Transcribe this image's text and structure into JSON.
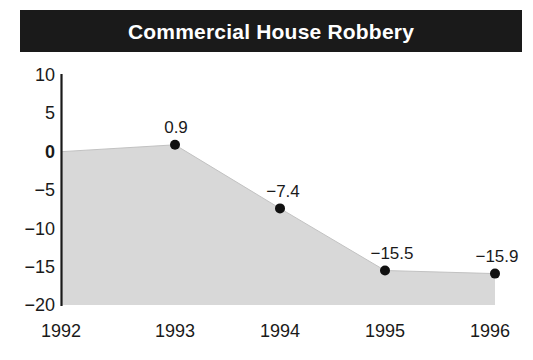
{
  "title": "Commercial House Robbery",
  "colors": {
    "title_bar_bg": "#1a1a1a",
    "title_text": "#ffffff",
    "area_fill": "#d8d8d8",
    "axis_line": "#1a1a1a",
    "marker": "#111111",
    "text": "#1a1a1a",
    "page_bg": "#ffffff"
  },
  "axis": {
    "y_ticks": [
      "10",
      "5",
      "0",
      "−5",
      "−10",
      "−15",
      "−20"
    ],
    "x_ticks": [
      "1992",
      "1993",
      "1994",
      "1995",
      "1996"
    ]
  },
  "point_labels": {
    "1993": "0.9",
    "1994": "−7.4",
    "1995": "−15.5",
    "1996": "−15.9"
  },
  "chart_data": {
    "type": "area",
    "title": "Commercial House Robbery",
    "subtitle": "",
    "xlabel": "",
    "ylabel": "",
    "categories": [
      "1992",
      "1993",
      "1994",
      "1995",
      "1996"
    ],
    "values": [
      0,
      0.9,
      -7.4,
      -15.5,
      -15.9
    ],
    "data_labels": [
      "",
      "0.9",
      "−7.4",
      "−15.5",
      "−15.9"
    ],
    "markers": [
      false,
      true,
      true,
      true,
      true
    ],
    "ylim": [
      -20,
      10
    ],
    "yticks": [
      10,
      5,
      0,
      -5,
      -10,
      -15,
      -20
    ],
    "ytick_labels": [
      "10",
      "5",
      "0",
      "−5",
      "−10",
      "−15",
      "−20"
    ],
    "grid": false,
    "legend": "none",
    "baseline": -20,
    "fill_color": "#d8d8d8",
    "marker_color": "#111111"
  }
}
